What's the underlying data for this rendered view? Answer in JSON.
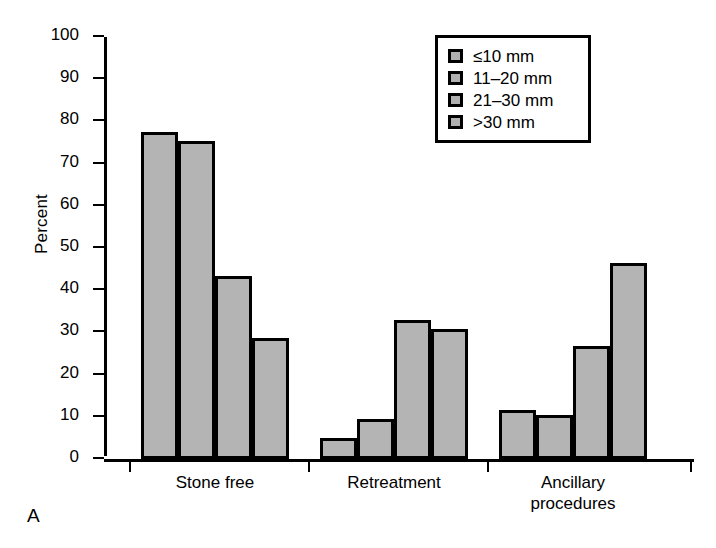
{
  "panel_label": "A",
  "chart_data": {
    "type": "bar",
    "title": "",
    "xlabel": "",
    "ylabel": "Percent",
    "ylim": [
      0,
      100
    ],
    "ytick_step": 10,
    "yticks": [
      0,
      10,
      20,
      30,
      40,
      50,
      60,
      70,
      80,
      90,
      100
    ],
    "grid": false,
    "legend_position": "top-right",
    "categories": [
      "Stone free",
      "Retreatment",
      "Ancillary\nprocedures"
    ],
    "series": [
      {
        "name": "≤10 mm",
        "values": [
          76.7,
          4.3,
          10.8
        ]
      },
      {
        "name": "11–20 mm",
        "values": [
          74.7,
          8.8,
          9.8
        ]
      },
      {
        "name": "21–30 mm",
        "values": [
          42.6,
          32.3,
          26.0
        ]
      },
      {
        "name": ">30 mm",
        "values": [
          27.9,
          30.0,
          45.7
        ]
      }
    ],
    "bar_fill": "#b4b4b4",
    "bar_border": "#000000"
  }
}
